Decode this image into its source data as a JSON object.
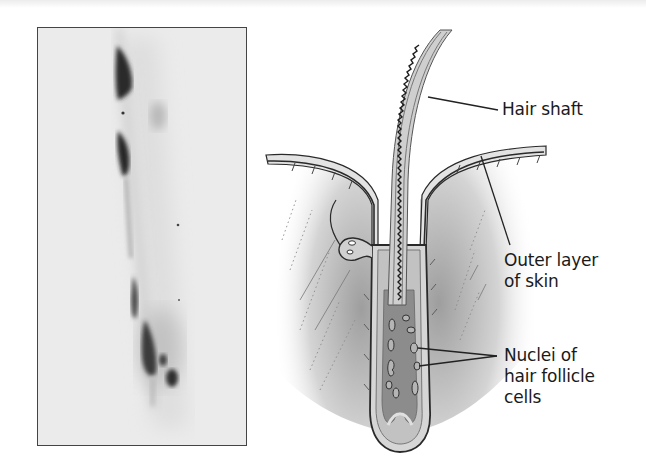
{
  "figure": {
    "photo": {
      "description": "Micrograph of a hair follicle showing dark-stained nuclei",
      "border_color": "#444444",
      "background_color": "#ececec"
    },
    "diagram": {
      "description": "Cross-section illustration of a hair follicle in skin",
      "labels": {
        "hair_shaft": "Hair shaft",
        "outer_layer": [
          "Outer layer",
          "of skin"
        ],
        "nuclei": [
          "Nuclei of",
          "hair follicle",
          "cells"
        ]
      },
      "colors": {
        "skin_shading": "#b8b8b8",
        "follicle_inner": "#8c8c8c",
        "outline": "#2a2a2a",
        "label_text": "#1a1a1a"
      }
    }
  }
}
